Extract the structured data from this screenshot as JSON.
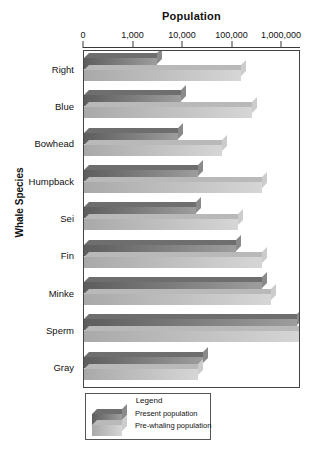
{
  "chart_data": {
    "type": "bar",
    "orientation": "horizontal",
    "title": "Population",
    "xlabel": "Population",
    "ylabel": "Whale Species",
    "xscale": "log",
    "xticks": [
      0,
      1000,
      10000,
      100000,
      1000000
    ],
    "xtick_labels": [
      "0",
      "1,000",
      "10,000",
      "100,000",
      "1,000,000"
    ],
    "xlim": [
      100,
      2000000
    ],
    "grid": false,
    "legend_position": "bottom-left",
    "legend_title": "Legend",
    "categories": [
      "Right",
      "Blue",
      "Bowhead",
      "Humpback",
      "Sei",
      "Fin",
      "Minke",
      "Sperm",
      "Gray"
    ],
    "series": [
      {
        "name": "Present population",
        "color": "#7c7c7c",
        "values": [
          3000,
          9000,
          8000,
          20000,
          18000,
          120000,
          400000,
          2000000,
          25000
        ]
      },
      {
        "name": "Pre-whaling population",
        "color": "#c4c4c4",
        "values": [
          150000,
          250000,
          60000,
          400000,
          130000,
          400000,
          600000,
          2500000,
          20000
        ]
      }
    ]
  },
  "axes": {
    "title": "Population",
    "y_axis_title": "Whale Species",
    "tick_labels": [
      "0",
      "1,000",
      "10,000",
      "100,000",
      "1,000,000"
    ],
    "category_labels": [
      "Right",
      "Blue",
      "Bowhead",
      "Humpback",
      "Sei",
      "Fin",
      "Minke",
      "Sperm",
      "Gray"
    ]
  },
  "legend": {
    "title": "Legend",
    "entries": [
      {
        "label": "Present population"
      },
      {
        "label": "Pre-whaling population"
      }
    ]
  }
}
